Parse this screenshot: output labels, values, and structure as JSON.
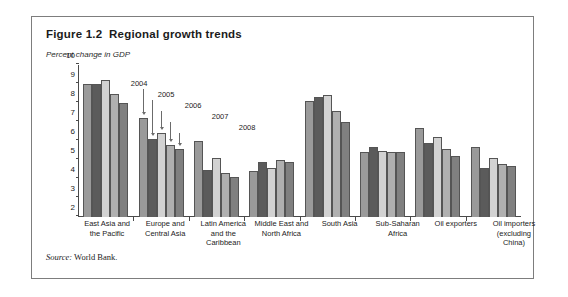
{
  "figure": {
    "title": "Figure 1.2  Regional growth trends",
    "subtitle": "Percent change in GDP",
    "source": {
      "label": "Source:",
      "text": " World Bank."
    }
  },
  "chart_data": {
    "type": "bar",
    "title": "Figure 1.2  Regional growth trends",
    "xlabel": "",
    "ylabel": "Percent change in GDP",
    "ylim": [
      2,
      10
    ],
    "yticks": [
      2,
      3,
      4,
      5,
      6,
      7,
      8,
      9,
      10
    ],
    "grid": false,
    "legend_position": "annotated-callouts",
    "categories": [
      "East Asia and the Pacific",
      "Europe and Central Asia",
      "Latin America and the Caribbean",
      "Middle East and North Africa",
      "South Asia",
      "Sub-Saharan Africa",
      "Oil exporters",
      "Oil importers (excluding China)"
    ],
    "series": [
      {
        "name": "2004",
        "color": "#9a9a9a",
        "values": [
          9.0,
          7.2,
          6.0,
          4.4,
          8.1,
          5.4,
          6.7,
          5.7
        ]
      },
      {
        "name": "2005",
        "color": "#5b5b5b",
        "values": [
          9.0,
          6.1,
          4.5,
          4.9,
          8.3,
          5.7,
          5.9,
          4.6
        ]
      },
      {
        "name": "2006",
        "color": "#d2d2d2",
        "values": [
          9.2,
          6.4,
          5.1,
          4.6,
          8.4,
          5.5,
          6.2,
          5.1
        ]
      },
      {
        "name": "2007",
        "color": "#b0b0b0",
        "values": [
          8.5,
          5.8,
          4.3,
          5.0,
          7.6,
          5.4,
          5.6,
          4.8
        ]
      },
      {
        "name": "2008",
        "color": "#808080",
        "values": [
          8.0,
          5.6,
          4.1,
          4.9,
          7.0,
          5.4,
          5.2,
          4.7
        ]
      }
    ],
    "annotations": [
      {
        "text": "2004",
        "series": "2004"
      },
      {
        "text": "2005",
        "series": "2005"
      },
      {
        "text": "2006",
        "series": "2006"
      },
      {
        "text": "2007",
        "series": "2007"
      },
      {
        "text": "2008",
        "series": "2008"
      }
    ]
  }
}
